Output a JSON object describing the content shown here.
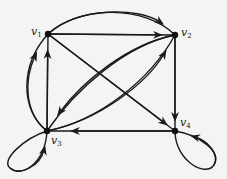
{
  "diagram": {
    "type": "directed-graph",
    "nodes": [
      {
        "id": "v1",
        "label": "v",
        "subscript": "1",
        "x": 48,
        "y": 34
      },
      {
        "id": "v2",
        "label": "v",
        "subscript": "2",
        "x": 175,
        "y": 35
      },
      {
        "id": "v3",
        "label": "v",
        "subscript": "3",
        "x": 47,
        "y": 131
      },
      {
        "id": "v4",
        "label": "v",
        "subscript": "4",
        "x": 175,
        "y": 131
      }
    ],
    "edges": [
      {
        "from": "v1",
        "to": "v2",
        "shape": "straight"
      },
      {
        "from": "v1",
        "to": "v2",
        "shape": "arc-top"
      },
      {
        "from": "v1",
        "to": "v4",
        "shape": "straight"
      },
      {
        "from": "v2",
        "to": "v4",
        "shape": "straight"
      },
      {
        "from": "v4",
        "to": "v3",
        "shape": "straight"
      },
      {
        "from": "v3",
        "to": "v1",
        "shape": "straight"
      },
      {
        "from": "v3",
        "to": "v1",
        "shape": "arc-left"
      },
      {
        "from": "v2",
        "to": "v3",
        "shape": "curve-upper"
      },
      {
        "from": "v3",
        "to": "v2",
        "shape": "curve-lower"
      },
      {
        "from": "v3",
        "to": "v3",
        "shape": "loop"
      },
      {
        "from": "v4",
        "to": "v4",
        "shape": "loop"
      }
    ],
    "colors": {
      "edge": "#1a1a1a",
      "node": "#111111",
      "background": "#f4f4f2"
    }
  }
}
